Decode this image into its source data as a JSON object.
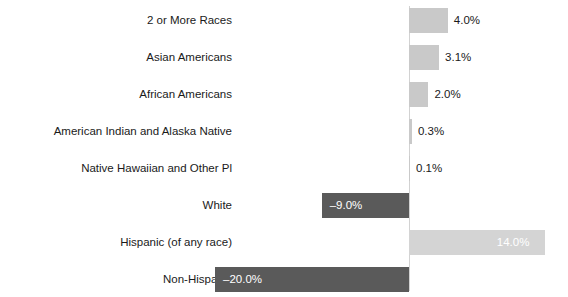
{
  "chart_data": {
    "type": "bar",
    "orientation": "horizontal",
    "title": "",
    "subtitle": "",
    "xlabel": "",
    "ylabel": "",
    "grid": false,
    "legend": "none",
    "axis_tick_labels": [],
    "zero_axis_visible": true,
    "xlim": [
      -20,
      14
    ],
    "categories": [
      "2 or More Races",
      "Asian Americans",
      "African Americans",
      "American Indian and Alaska Native",
      "Native Hawaiian and Other Pl",
      "White",
      "Hispanic (of any race)",
      "Non-Hispanic"
    ],
    "values": [
      4.0,
      3.1,
      2.0,
      0.3,
      0.1,
      -9.0,
      14.0,
      -20.0
    ],
    "data_labels": [
      "4.0%",
      "3.1%",
      "2.0%",
      "0.3%",
      "0.1%",
      "–9.0%",
      "14.0%",
      "–20.0%"
    ],
    "label_placement": [
      "outside-end",
      "outside-end",
      "outside-end",
      "outside-end",
      "outside-end",
      "inside-end",
      "inside-end",
      "inside-end"
    ],
    "bar_colors": [
      "#c9c9c9",
      "#c9c9c9",
      "#c9c9c9",
      "#c9c9c9",
      "#c9c9c9",
      "#5a5a5a",
      "#d4d4d4",
      "#5a5a5a"
    ],
    "label_colors": [
      "#1a1a1a",
      "#1a1a1a",
      "#1a1a1a",
      "#1a1a1a",
      "#1a1a1a",
      "#ffffff",
      "#ffffff",
      "#ffffff"
    ]
  },
  "style": {
    "background": "#ffffff",
    "axis_color": "#d2d2d2",
    "text_color": "#1a1a1a",
    "positive_color": "#c9c9c9",
    "positive_light_color": "#d4d4d4",
    "negative_color": "#5a5a5a"
  },
  "geometry": {
    "zero_x": 409,
    "px_per_percent": 9.7,
    "row_pitch": 37,
    "bar_height": 25,
    "first_row_top": 8
  }
}
